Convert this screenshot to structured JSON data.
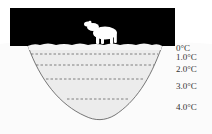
{
  "diagram": {
    "title": "",
    "colors": {
      "sky": "#000000",
      "ice": "#f4f4f4",
      "water": "#ececec",
      "basin_outline": "#555555",
      "dashed_line": "#666666",
      "bear": "#ffffff"
    },
    "labels": [
      {
        "text": "0°C",
        "top": 44
      },
      {
        "text": "1.0°C",
        "top": 53
      },
      {
        "text": "2.0°C",
        "top": 65
      },
      {
        "text": "3.0°C",
        "top": 82
      },
      {
        "text": "4.0°C",
        "top": 103
      }
    ],
    "layers": [
      {
        "name": "ice",
        "y": 47
      },
      {
        "name": "1.0",
        "y": 54
      },
      {
        "name": "2.0",
        "y": 65
      },
      {
        "name": "3.0",
        "y": 79
      },
      {
        "name": "4.0",
        "y": 99
      }
    ]
  }
}
